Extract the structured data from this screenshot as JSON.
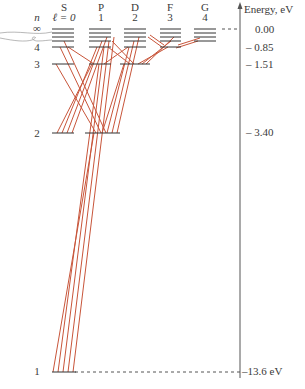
{
  "axis": {
    "title": "Energy, eV",
    "ticks": [
      {
        "label": "0.00",
        "energy": 0.0
      },
      {
        "label": "– 0.85",
        "energy": -0.85
      },
      {
        "label": "– 1.51",
        "energy": -1.51
      },
      {
        "label": "– 3.40",
        "energy": -3.4
      },
      {
        "label": "–13.6 eV",
        "energy": -13.6
      }
    ]
  },
  "header": {
    "n_label": "n",
    "columns": [
      {
        "letter": "S",
        "l": "ℓ = 0"
      },
      {
        "letter": "P",
        "l": "1"
      },
      {
        "letter": "D",
        "l": "2"
      },
      {
        "letter": "F",
        "l": "3"
      },
      {
        "letter": "G",
        "l": "4"
      }
    ]
  },
  "n_labels": [
    {
      "label": "∞",
      "y": 29
    },
    {
      "label": "4",
      "y": 47
    },
    {
      "label": "3",
      "y": 64
    },
    {
      "label": "2",
      "y": 133
    },
    {
      "label": "1",
      "y": 372
    }
  ],
  "levels": {
    "n1": -13.6,
    "n2": -3.4,
    "n3": -1.51,
    "n4": -0.85,
    "ninf": 0.0
  },
  "colors": {
    "level_line": "#333333",
    "transition": "#c8553a",
    "axis": "#555555"
  }
}
